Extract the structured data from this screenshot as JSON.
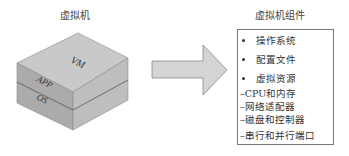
{
  "left_panel": {
    "title": "虚拟机",
    "cube": {
      "top_label": "VM",
      "layer_upper": "APP",
      "layer_lower": "OS"
    }
  },
  "arrow": {
    "direction": "right",
    "fill": "#d4d4d4",
    "stroke": "#888888"
  },
  "right_panel": {
    "title": "虚拟机组件",
    "bullets": [
      {
        "label": "操作系统"
      },
      {
        "label": "配置文件"
      },
      {
        "label": "虚拟资源"
      }
    ],
    "sub_items": [
      {
        "label": "–CPU和内存"
      },
      {
        "label": "–网络适配器"
      },
      {
        "label": "–磁盘和控制器"
      },
      {
        "label": "–串行和并行端口"
      }
    ]
  },
  "colors": {
    "cube_top": "#c8c8c8",
    "cube_left": "#aaaaaa",
    "cube_right": "#bdbdbd",
    "box_border": "#777777"
  }
}
